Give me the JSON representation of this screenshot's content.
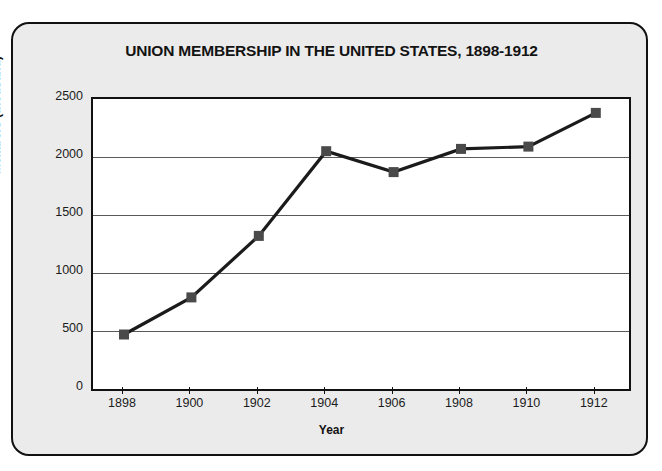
{
  "chart_data": {
    "type": "line",
    "title": "UNION MEMBERSHIP IN THE UNITED STATES, 1898-1912",
    "xlabel": "Year",
    "ylabel": "Members (thousand)",
    "x": [
      1898,
      1900,
      1902,
      1904,
      1906,
      1908,
      1910,
      1912
    ],
    "xtick_labels": [
      "1898",
      "1900",
      "1902",
      "1904",
      "1906",
      "1908",
      "1910",
      "1912"
    ],
    "values": [
      470,
      790,
      1320,
      2050,
      1870,
      2070,
      2090,
      2380
    ],
    "series": [
      {
        "name": "Union membership",
        "values": [
          470,
          790,
          1320,
          2050,
          1870,
          2070,
          2090,
          2380
        ]
      }
    ],
    "ylim": [
      0,
      2500
    ],
    "xlim": [
      1897.5,
      1912.5
    ],
    "yticks": [
      0,
      500,
      1000,
      1500,
      2000,
      2500
    ],
    "ytick_labels": [
      "0",
      "500",
      "1000",
      "1500",
      "2000",
      "2500"
    ],
    "grid": "horizontal",
    "legend": "none",
    "marker": "square",
    "line_color": "#1b1b1b",
    "marker_color": "#4a4a4a",
    "plot_background": "#ffffff",
    "card_background": "#ebebeb"
  }
}
